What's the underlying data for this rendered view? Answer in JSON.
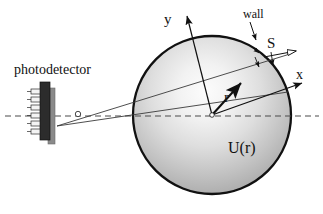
{
  "figure": {
    "width": 323,
    "height": 214,
    "background": "#ffffff",
    "line_color": "#111111"
  },
  "labels": {
    "photodetector": "photodetector",
    "wall": "wall",
    "poynting_vector": "S",
    "axis_y": "y",
    "axis_x": "x",
    "radius_vector": "r",
    "potential": "U(r)"
  },
  "geometry": {
    "sphere": {
      "center_x": 212,
      "center_y": 115,
      "radius": 79,
      "stroke": "#111111",
      "stroke_width": 2.2,
      "fill_description": "radial-gradient light center to grey edge"
    },
    "gradient": {
      "inner_color": "#fbfbfb",
      "mid_color": "#d8d8d8",
      "outer_color": "#9a9a9a",
      "focal_x": 205,
      "focal_y": 88
    },
    "axes": {
      "y_axis": {
        "from_x": 212,
        "from_y": 115,
        "to_x": 187,
        "to_y": 14
      },
      "x_axis": {
        "from_x": 212,
        "from_y": 115,
        "to_x": 303,
        "to_y": 83
      },
      "r_vector": {
        "from_x": 212,
        "from_y": 115,
        "to_x": 240,
        "to_y": 83
      }
    },
    "optical_axis": {
      "y": 116,
      "from_x": 5,
      "to_x": 318,
      "dash": "6 4",
      "color": "#555555"
    },
    "pinhole": {
      "x": 78,
      "y": 114,
      "r": 2.6
    },
    "detector": {
      "bar_x": 41,
      "bar_y": 84,
      "bar_w": 9,
      "bar_h": 56,
      "teeth_count": 6,
      "body_color": "#2b2b2b",
      "plate_color": "#6f6f6f"
    },
    "surface_element": {
      "label_x": 270,
      "label_y": 44,
      "arrow_from_x": 265,
      "arrow_from_y": 60,
      "arrow_to_x": 296,
      "arrow_to_y": 53
    }
  }
}
